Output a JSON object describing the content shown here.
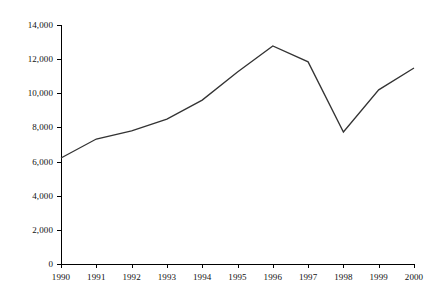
{
  "chart_data": {
    "type": "line",
    "title": "",
    "subtitle": "",
    "xlabel": "",
    "ylabel": "",
    "categories": [
      "1990",
      "1991",
      "1992",
      "1993",
      "1994",
      "1995",
      "1996",
      "1997",
      "1998",
      "1999",
      "2000"
    ],
    "values": [
      6210,
      7320,
      7800,
      8490,
      9600,
      11250,
      12770,
      11840,
      7730,
      10200,
      11480
    ],
    "series": [
      {
        "name": "",
        "values": [
          6210,
          7320,
          7800,
          8490,
          9600,
          11250,
          12770,
          11840,
          7730,
          10200,
          11480
        ]
      }
    ],
    "ylim": [
      0,
      14000
    ],
    "ytick_values": [
      0,
      2000,
      4000,
      6000,
      8000,
      10000,
      12000,
      14000
    ],
    "ytick_labels": [
      "0",
      "2,000",
      "4,000",
      "6,000",
      "8,000",
      "10,000",
      "12,000",
      "14,000"
    ],
    "xtick_labels": [
      "1990",
      "1991",
      "1992",
      "1993",
      "1994",
      "1995",
      "1996",
      "1997",
      "1998",
      "1999",
      "2000"
    ],
    "grid": false,
    "legend": false,
    "legend_position": "none",
    "line_color": "#333333",
    "axis_color": "#000000",
    "background_color": "#ffffff",
    "annotations": []
  },
  "axes": {
    "plot_left_px": 61,
    "plot_right_px": 414,
    "plot_top_px": 25,
    "plot_bottom_px": 264
  }
}
